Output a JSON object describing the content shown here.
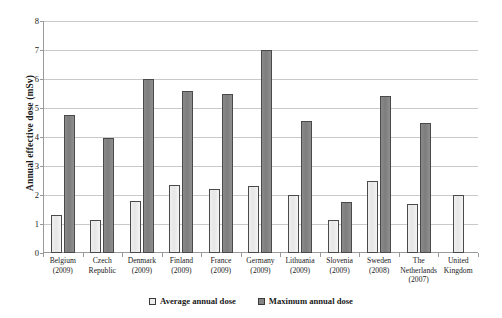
{
  "chart_data": {
    "type": "bar",
    "title": "",
    "xlabel": "",
    "ylabel": "Annual effective dose (mSv)",
    "ylim": [
      0,
      8
    ],
    "ytick_step": 1,
    "yticks": [
      "8",
      "7",
      "6",
      "5",
      "4",
      "3",
      "2",
      "1",
      "0"
    ],
    "grid": true,
    "legend_position": "bottom",
    "categories": [
      "Belgium\n(2009)",
      "Czech Republic",
      "Denmark\n(2009)",
      "Finland\n(2009)",
      "France\n(2009)",
      "Germany\n(2009)",
      "Lithuania\n(2009)",
      "Slovenia\n(2009)",
      "Sweden\n(2008)",
      "The Netherlands\n(2007)",
      "United Kingdom"
    ],
    "category_lines": [
      [
        "Belgium",
        "(2009)"
      ],
      [
        "Czech",
        "Republic"
      ],
      [
        "Denmark",
        "(2009)"
      ],
      [
        "Finland",
        "(2009)"
      ],
      [
        "France",
        "(2009)"
      ],
      [
        "Germany",
        "(2009)"
      ],
      [
        "Lithuania",
        "(2009)"
      ],
      [
        "Slovenia",
        "(2009)"
      ],
      [
        "Sweden",
        "(2008)"
      ],
      [
        "The",
        "Netherlands",
        "(2007)"
      ],
      [
        "United",
        "Kingdom"
      ]
    ],
    "series": [
      {
        "name": "Average annual dose",
        "color": "#ededed",
        "values": [
          1.3,
          1.15,
          1.8,
          2.35,
          2.2,
          2.3,
          2.0,
          1.15,
          2.5,
          1.7,
          2.0
        ]
      },
      {
        "name": "Maximum annual dose",
        "color": "#858585",
        "values": [
          4.75,
          3.95,
          6.0,
          5.6,
          5.5,
          7.0,
          4.55,
          1.75,
          5.4,
          4.5,
          null
        ]
      }
    ]
  },
  "legend": {
    "items": [
      {
        "label": "Average annual dose"
      },
      {
        "label": "Maximum annual dose"
      }
    ]
  }
}
